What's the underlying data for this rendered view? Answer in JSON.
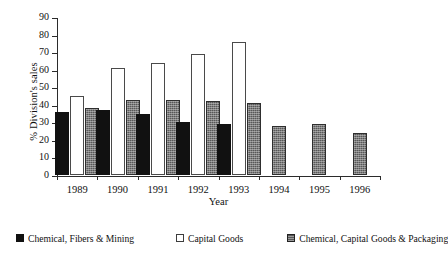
{
  "chart_data": {
    "type": "bar",
    "title": "",
    "xlabel": "Year",
    "ylabel": "% Division's sales",
    "categories": [
      "1989",
      "1990",
      "1991",
      "1992",
      "1993",
      "1994",
      "1995",
      "1996"
    ],
    "ylim": [
      0,
      90
    ],
    "ytick_step": 10,
    "yticks": [
      "90",
      "80",
      "70",
      "60",
      "50",
      "40",
      "30",
      "20",
      "10",
      "0"
    ],
    "grid": false,
    "legend_position": "bottom",
    "series": [
      {
        "name": "Chemical, Fibers & Mining",
        "style": "solid-black",
        "color": "#111111",
        "values": [
          36,
          37,
          35,
          30,
          29,
          null,
          null,
          null
        ]
      },
      {
        "name": "Capital Goods",
        "style": "hollow-white",
        "color": "#ffffff",
        "values": [
          45,
          61,
          64,
          69,
          76,
          null,
          null,
          null
        ]
      },
      {
        "name": "Chemical, Capital Goods & Packaging",
        "style": "stippled-grey",
        "color": "#585858",
        "values": [
          38,
          43,
          43,
          42,
          41,
          28,
          29,
          24
        ]
      }
    ]
  }
}
